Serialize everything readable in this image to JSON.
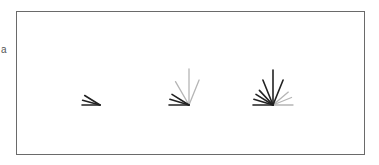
{
  "figure": {
    "edge_label": "a",
    "frame": {
      "x": 16,
      "y": 11,
      "width": 349,
      "height": 144,
      "border_color": "#6a6a6a"
    },
    "colors": {
      "dark": "#222222",
      "light": "#b5b5b5"
    },
    "glyphs": [
      {
        "name": "glyph-stage-1",
        "origin": [
          100,
          105
        ],
        "rays": [
          {
            "angle": 180,
            "length": 18,
            "tone": "dark"
          },
          {
            "angle": 165,
            "length": 18,
            "tone": "dark"
          },
          {
            "angle": 148,
            "length": 18,
            "tone": "dark"
          }
        ]
      },
      {
        "name": "glyph-stage-2",
        "origin": [
          189,
          105
        ],
        "rays": [
          {
            "angle": 180,
            "length": 20,
            "tone": "dark"
          },
          {
            "angle": 163,
            "length": 20,
            "tone": "dark"
          },
          {
            "angle": 148,
            "length": 20,
            "tone": "dark"
          },
          {
            "angle": 120,
            "length": 27,
            "tone": "light"
          },
          {
            "angle": 90,
            "length": 36,
            "tone": "light"
          },
          {
            "angle": 68,
            "length": 27,
            "tone": "light"
          }
        ]
      },
      {
        "name": "glyph-stage-3",
        "origin": [
          273,
          105
        ],
        "rays": [
          {
            "angle": 180,
            "length": 20,
            "tone": "dark"
          },
          {
            "angle": 163,
            "length": 20,
            "tone": "dark"
          },
          {
            "angle": 148,
            "length": 20,
            "tone": "dark"
          },
          {
            "angle": 133,
            "length": 20,
            "tone": "dark"
          },
          {
            "angle": 112,
            "length": 27,
            "tone": "dark"
          },
          {
            "angle": 90,
            "length": 35,
            "tone": "dark"
          },
          {
            "angle": 68,
            "length": 27,
            "tone": "dark"
          },
          {
            "angle": 40,
            "length": 20,
            "tone": "light"
          },
          {
            "angle": 22,
            "length": 20,
            "tone": "light"
          },
          {
            "angle": 0,
            "length": 20,
            "tone": "light"
          }
        ]
      }
    ]
  }
}
